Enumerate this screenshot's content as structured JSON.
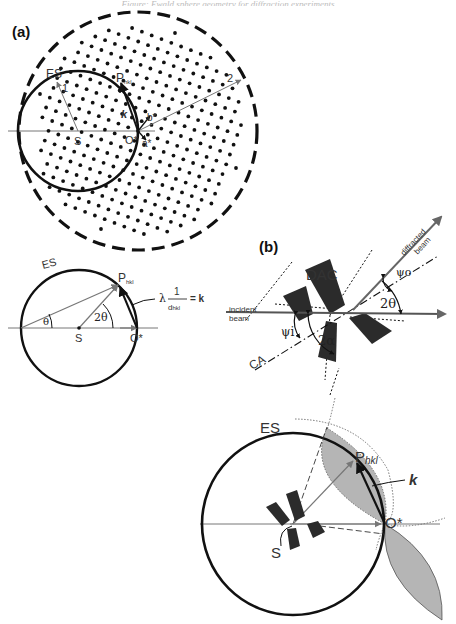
{
  "header": {
    "text": "Figure: Ewald sphere geometry for diffraction experiments"
  },
  "panel_a": {
    "label": "(a)",
    "es_label": "ES",
    "radius1_label": "1",
    "radius2_label": "2",
    "p_label": "P",
    "p_sub": "hkl",
    "k_label": "k",
    "s_label": "S",
    "o_label": "O*",
    "a_label": "a*",
    "b_label": "b*"
  },
  "panel_a2": {
    "es_label": "ES",
    "p_label": "P",
    "p_sub": "hkl",
    "theta_label": "θ",
    "two_theta_label": "2θ",
    "s_label": "S",
    "o_label": "O*",
    "lambda_label": "λ",
    "frac_num": "1",
    "frac_den": "d",
    "frac_den_sub": "hkl",
    "equals_k": "= k"
  },
  "panel_b": {
    "label": "(b)",
    "dac_label": "DAC",
    "incident_label_1": "incident",
    "incident_label_2": "beam",
    "diffracted_label_1": "diffracted",
    "diffracted_label_2": "beam",
    "psi_o_label": "ψo",
    "psi_i_label": "ψi",
    "two_theta_label": "2θ",
    "two_alpha_label": "2α",
    "ca_label": "CA"
  },
  "panel_c": {
    "es_label": "ES",
    "p_label": "P",
    "p_sub": "hkl",
    "k_label": "k",
    "o_label": "O*",
    "s_label": "S"
  },
  "colors": {
    "line": "#111111",
    "thin_line": "#777777",
    "shaded_region": "#b5b5b5",
    "dac_block": "#2b2b2b"
  }
}
